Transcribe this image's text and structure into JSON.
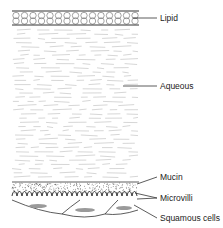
{
  "layers": [
    {
      "name": "lipid",
      "label": "Lipid"
    },
    {
      "name": "aqueous",
      "label": "Aqueous"
    },
    {
      "name": "mucin",
      "label": "Mucin"
    },
    {
      "name": "microvilli",
      "label": "Microvilli"
    },
    {
      "name": "squamous",
      "label": "Squamous cells"
    }
  ],
  "colors": {
    "line": "#333333",
    "aqueous_dash": "#c8c8c8",
    "dots": "#555555",
    "cell_nucleus": "#9a9a9a"
  }
}
